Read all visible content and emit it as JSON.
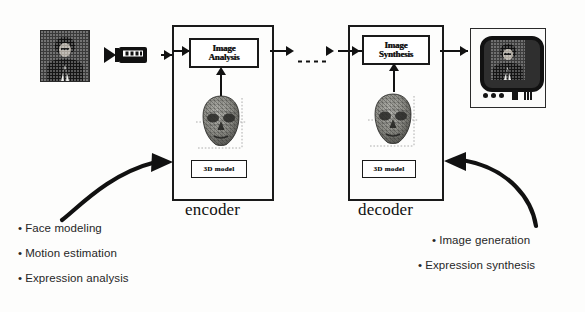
{
  "diagram": {
    "background_color": "#fdfdfc",
    "ink_color": "#121212"
  },
  "input": {
    "photo_name": "input face photograph",
    "camera_icon": "video-camera-icon"
  },
  "encoder": {
    "caption": "encoder",
    "process_line1": "Image",
    "process_line2": "Analysis",
    "model_label": "3D model",
    "head_icon": "wireframe-head-mesh"
  },
  "decoder": {
    "caption": "decoder",
    "process_line1": "Image",
    "process_line2": "Synthesis",
    "model_label": "3D model",
    "head_icon": "wireframe-head-mesh"
  },
  "transmission": {
    "channel_style": "dashed-arrow",
    "label": ""
  },
  "output": {
    "display_icon": "television-monitor-icon",
    "screen_content": "synthesized face"
  },
  "encoder_tasks": {
    "items": [
      "Face modeling",
      "Motion estimation",
      "Expression analysis"
    ],
    "bullet_glyph": "•"
  },
  "decoder_tasks": {
    "items": [
      "Image generation",
      "Expression synthesis"
    ],
    "bullet_glyph": "•"
  }
}
